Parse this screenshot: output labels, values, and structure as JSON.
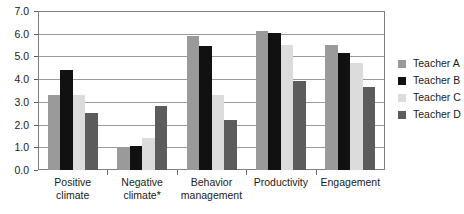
{
  "chart_data": {
    "type": "bar",
    "title": "",
    "subtitle": "",
    "xlabel": "",
    "ylabel": "",
    "categories": [
      "Positive climate",
      "Negative climate*",
      "Behavior management",
      "Productivity",
      "Engagement"
    ],
    "series": [
      {
        "name": "Teacher A",
        "color": "#9a9a9a",
        "values": [
          3.3,
          1.0,
          5.9,
          6.1,
          5.5
        ]
      },
      {
        "name": "Teacher B",
        "color": "#111111",
        "values": [
          4.4,
          1.05,
          5.45,
          6.05,
          5.15
        ]
      },
      {
        "name": "Teacher C",
        "color": "#dcdcdc",
        "values": [
          3.3,
          1.4,
          3.3,
          5.5,
          4.7
        ]
      },
      {
        "name": "Teacher D",
        "color": "#5c5c5c",
        "values": [
          2.5,
          2.8,
          2.2,
          3.9,
          3.65
        ]
      }
    ],
    "ylim": [
      0,
      7
    ],
    "ytick_step": 1.0,
    "ytick_labels": [
      "7.0",
      "6.0",
      "5.0",
      "4.0",
      "3.0",
      "2.0",
      "1.0",
      "0.0"
    ],
    "ytick_values": [
      7.0,
      6.0,
      5.0,
      4.0,
      3.0,
      2.0,
      1.0,
      0.0
    ],
    "grid": true,
    "legend_position": "right",
    "frame_color": "#808080",
    "gridline_color": "#9b9b9b",
    "background": "#ffffff"
  },
  "axis": {
    "y_labels": [
      "7.0",
      "6.0",
      "5.0",
      "4.0",
      "3.0",
      "2.0",
      "1.0",
      "0.0"
    ],
    "x_labels": [
      {
        "line1": "Positive",
        "line2": "climate"
      },
      {
        "line1": "Negative",
        "line2": "climate*"
      },
      {
        "line1": "Behavior",
        "line2": "management"
      },
      {
        "line1": "Productivity",
        "line2": ""
      },
      {
        "line1": "Engagement",
        "line2": ""
      }
    ]
  },
  "legend": {
    "items": [
      {
        "label": "Teacher A",
        "color": "#9a9a9a"
      },
      {
        "label": "Teacher B",
        "color": "#111111"
      },
      {
        "label": "Teacher C",
        "color": "#dcdcdc"
      },
      {
        "label": "Teacher D",
        "color": "#5c5c5c"
      }
    ]
  }
}
